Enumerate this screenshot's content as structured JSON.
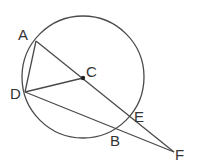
{
  "diagram": {
    "type": "geometry",
    "stroke_color": "#4a4a4a",
    "circle": {
      "center": "C",
      "cx": 83,
      "cy": 77,
      "r": 61
    },
    "points": {
      "A": {
        "label": "A",
        "x": 36,
        "y": 41,
        "lx": 18,
        "ly": 40
      },
      "C": {
        "label": "C",
        "x": 83,
        "y": 78,
        "lx": 86,
        "ly": 77
      },
      "D": {
        "label": "D",
        "x": 25,
        "y": 92,
        "lx": 10,
        "ly": 99
      },
      "E": {
        "label": "E",
        "x": 129,
        "y": 116,
        "lx": 134,
        "ly": 122
      },
      "B": {
        "label": "B",
        "x": 116,
        "y": 129,
        "lx": 110,
        "ly": 146
      },
      "F": {
        "label": "F",
        "x": 174,
        "y": 152,
        "lx": 175,
        "ly": 160
      }
    },
    "segments": [
      {
        "from": "A",
        "to": "F"
      },
      {
        "from": "A",
        "to": "D"
      },
      {
        "from": "D",
        "to": "C"
      },
      {
        "from": "D",
        "to": "F"
      }
    ]
  }
}
